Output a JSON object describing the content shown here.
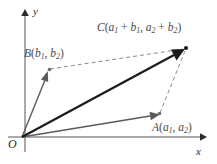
{
  "figure": {
    "type": "vector-addition-parallelogram-diagram",
    "background_color": "#ffffff"
  },
  "axes": {
    "x_label": "x",
    "y_label": "y",
    "origin_label": "O",
    "x_axis": {
      "x1": 8,
      "y1": 137,
      "x2": 203,
      "y2": 137,
      "color": "#555555"
    },
    "y_axis": {
      "x1": 25,
      "y1": 10,
      "x2": 25,
      "y2": 152,
      "color": "#555555"
    }
  },
  "points": [
    {
      "name": "O",
      "label": "O",
      "x": 22,
      "y": 137
    },
    {
      "name": "A",
      "label": "A(a1, a2)",
      "x": 159,
      "y": 114
    },
    {
      "name": "B",
      "label": "B(b1, b2)",
      "x": 49,
      "y": 69
    },
    {
      "name": "C",
      "label": "C(a1 + b1, a2 + b2)",
      "x": 186,
      "y": 48
    }
  ],
  "labels": {
    "c": {
      "name": "C",
      "open": "(",
      "term1_base": "a",
      "term1_sub": "1",
      "plus1": " + ",
      "term2_base": "b",
      "term2_sub": "1",
      "comma": ", ",
      "term3_base": "a",
      "term3_sub": "2",
      "plus2": " + ",
      "term4_base": "b",
      "term4_sub": "2",
      "close": ")"
    },
    "b": {
      "name": "B",
      "open": "(",
      "term1_base": "b",
      "term1_sub": "1",
      "comma": ", ",
      "term2_base": "b",
      "term2_sub": "2",
      "close": ")"
    },
    "a": {
      "name": "A",
      "open": "(",
      "term1_base": "a",
      "term1_sub": "1",
      "comma": ", ",
      "term2_base": "a",
      "term2_sub": "2",
      "close": ")"
    }
  },
  "vectors": [
    {
      "name": "OA",
      "from": "O",
      "to": "A",
      "style": "solid",
      "color": "#5a5a5a",
      "width": 1.4
    },
    {
      "name": "OB",
      "from": "O",
      "to": "B",
      "style": "solid",
      "color": "#5a5a5a",
      "width": 1.4
    },
    {
      "name": "OC",
      "from": "O",
      "to": "C",
      "style": "solid",
      "color": "#1c1c1c",
      "width": 2.3
    }
  ],
  "dashed_edges": [
    {
      "name": "BC",
      "from": "B",
      "to": "C",
      "style": "dashed",
      "color": "#8a8a8a"
    },
    {
      "name": "AC",
      "from": "A",
      "to": "C",
      "style": "dashed",
      "color": "#8a8a8a"
    }
  ],
  "colors": {
    "axis": "#555555",
    "vector_light": "#5a5a5a",
    "vector_dark": "#1c1c1c",
    "dashed": "#8a8a8a",
    "text": "#3a3a3a"
  }
}
